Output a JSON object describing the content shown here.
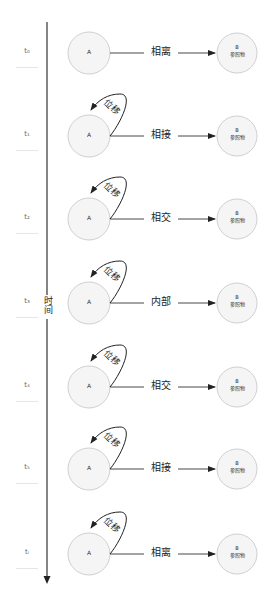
{
  "axis": {
    "label": "时间"
  },
  "rows": [
    {
      "time": "t₀",
      "relation": "相离",
      "displacement": "",
      "a_label": "A",
      "b_label": "B",
      "b_sub": "参照物"
    },
    {
      "time": "t₁",
      "relation": "相接",
      "displacement": "位移",
      "a_label": "A",
      "b_label": "B",
      "b_sub": "参照物"
    },
    {
      "time": "t₂",
      "relation": "相交",
      "displacement": "位移",
      "a_label": "A",
      "b_label": "B",
      "b_sub": "参照物"
    },
    {
      "time": "t₃",
      "relation": "内部",
      "displacement": "位移",
      "a_label": "A",
      "b_label": "B",
      "b_sub": "参照物"
    },
    {
      "time": "t₄",
      "relation": "相交",
      "displacement": "位移",
      "a_label": "A",
      "b_label": "B",
      "b_sub": "参照物"
    },
    {
      "time": "t₅",
      "relation": "相接",
      "displacement": "位移",
      "a_label": "A",
      "b_label": "B",
      "b_sub": "参照物"
    },
    {
      "time": "tᵢ",
      "relation": "相离",
      "displacement": "位移",
      "a_label": "A",
      "b_label": "B",
      "b_sub": "参照物"
    }
  ]
}
